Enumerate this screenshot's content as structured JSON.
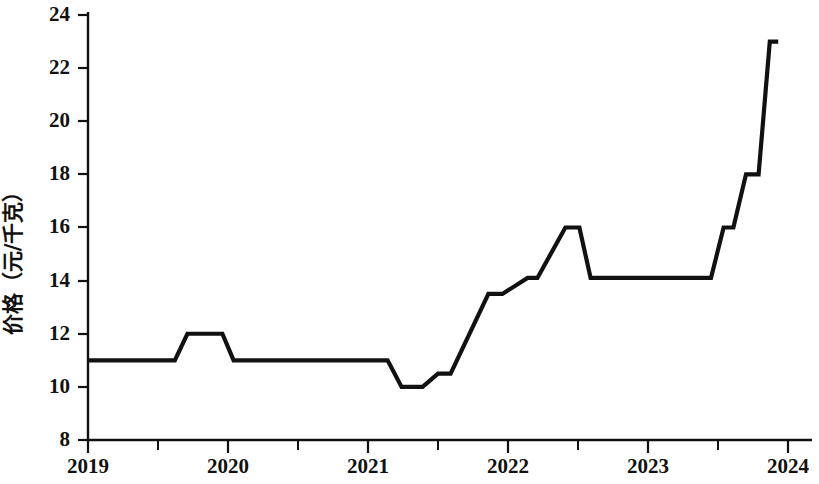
{
  "chart_data": {
    "type": "line",
    "title": "",
    "subtitle": "",
    "xlabel": "",
    "ylabel": "价格（元/千克）",
    "xlim": [
      2019,
      2024
    ],
    "ylim": [
      8,
      24
    ],
    "grid": false,
    "legend": "none",
    "y_ticks": [
      8,
      10,
      12,
      14,
      16,
      18,
      20,
      22,
      24
    ],
    "y_tick_labels": [
      "8",
      "10",
      "12",
      "14",
      "16",
      "18",
      "20",
      "22",
      "24"
    ],
    "x_ticks": [
      2019,
      2020,
      2021,
      2022,
      2023,
      2024
    ],
    "x_tick_labels": [
      "2019",
      "2020",
      "2021",
      "2022",
      "2023",
      "2024"
    ],
    "x_minor_ticks": [
      2019.5,
      2020.5,
      2021.5,
      2022.5,
      2023.5
    ],
    "series": [
      {
        "name": "价格",
        "color": "#111111",
        "x": [
          2019.0,
          2019.62,
          2019.71,
          2019.96,
          2020.04,
          2021.14,
          2021.24,
          2021.39,
          2021.5,
          2021.59,
          2021.86,
          2021.96,
          2022.14,
          2022.21,
          2022.41,
          2022.51,
          2022.59,
          2023.45,
          2023.54,
          2023.61,
          2023.7,
          2023.79,
          2023.87,
          2023.93
        ],
        "values": [
          11.0,
          11.0,
          12.0,
          12.0,
          11.0,
          11.0,
          10.0,
          10.0,
          10.5,
          10.5,
          13.5,
          13.5,
          14.1,
          14.1,
          16.0,
          16.0,
          14.1,
          14.1,
          16.0,
          16.0,
          18.0,
          18.0,
          23.0,
          23.0
        ]
      }
    ],
    "annotations": [],
    "notable_points": {
      "start_value": 11.0,
      "min_value": 10.0,
      "max_value": 23.0,
      "end_value": 23.0,
      "mid_peak_value": 16.0
    }
  }
}
